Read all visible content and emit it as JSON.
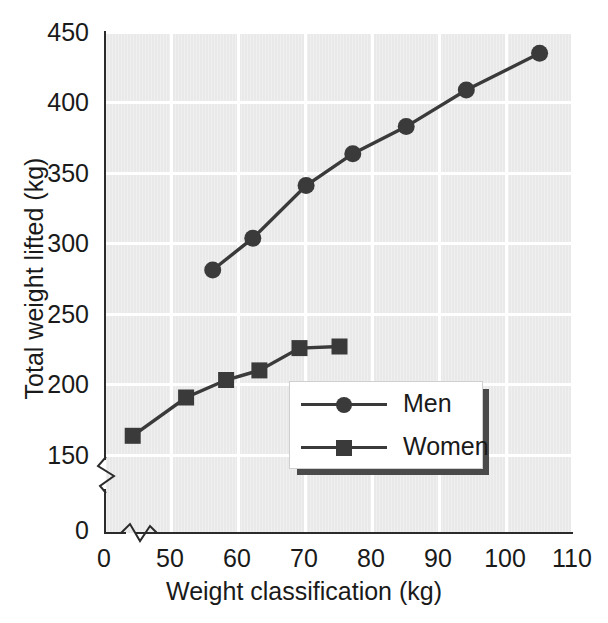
{
  "chart_data": {
    "type": "line",
    "title": "",
    "xlabel": "Weight classification (kg)",
    "ylabel": "Total weight lifted (kg)",
    "xlim": [
      40,
      110
    ],
    "ylim": [
      140,
      455
    ],
    "xticks": [
      "0",
      "50",
      "60",
      "70",
      "80",
      "90",
      "100",
      "110"
    ],
    "xtick_values": [
      0,
      50,
      60,
      70,
      80,
      90,
      100,
      110
    ],
    "yticks": [
      "0",
      "150",
      "200",
      "250",
      "300",
      "350",
      "400",
      "450"
    ],
    "ytick_values": [
      0,
      150,
      200,
      250,
      300,
      350,
      400,
      450
    ],
    "grid": true,
    "axis_break_x": true,
    "axis_break_y": true,
    "legend_position": "inside-lower-right",
    "series": [
      {
        "name": "Men",
        "marker": "circle",
        "color": "#3a3a3a",
        "x": [
          56,
          62,
          70,
          77,
          85,
          94,
          105
        ],
        "values": [
          305,
          325,
          358,
          378,
          395,
          418,
          441
        ]
      },
      {
        "name": "Women",
        "marker": "square",
        "color": "#3a3a3a",
        "x": [
          44,
          52,
          58,
          63,
          69,
          75
        ],
        "values": [
          201,
          225,
          236,
          242,
          256,
          257
        ]
      }
    ]
  },
  "legend": {
    "entries": [
      {
        "label": "Men"
      },
      {
        "label": "Women"
      }
    ]
  },
  "colors": {
    "plot_background": "#e9e9e9",
    "gridline": "#ffffff",
    "axis": "#2b2b2b",
    "series": "#3a3a3a",
    "text": "#1a1a1a",
    "legend_shadow": "#4a4a4a"
  }
}
